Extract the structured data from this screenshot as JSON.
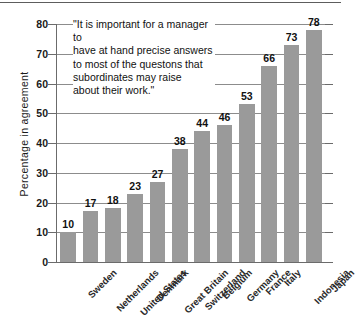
{
  "chart_data": {
    "type": "bar",
    "title": "",
    "xlabel": "",
    "ylabel": "Percentage in  agreement",
    "ylim": [
      0,
      80
    ],
    "yticks": [
      0,
      10,
      20,
      30,
      40,
      50,
      60,
      70,
      80
    ],
    "grid": true,
    "legend": null,
    "bar_color": "#9a9a9a",
    "categories": [
      "Sweden",
      "Netherlands",
      "United States",
      "Denmark",
      "Great Britain",
      "Switzerland",
      "Belgium",
      "Germany",
      "France",
      "Italy",
      "Indonesia",
      "Japan"
    ],
    "values": [
      10,
      17,
      18,
      23,
      27,
      38,
      44,
      46,
      53,
      66,
      73,
      78
    ],
    "annotation": "\"It is important for a manager to\nhave at hand precise answers\nto most of the questons that\nsubordinates may raise\nabout their work.\""
  }
}
